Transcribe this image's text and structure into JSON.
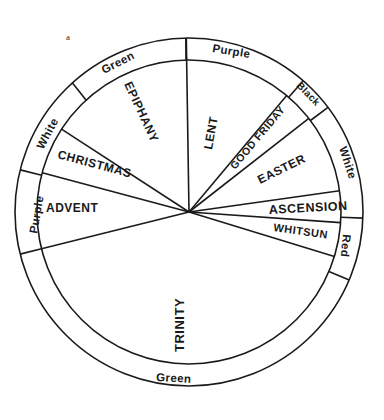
{
  "figure_label": "a",
  "geometry": {
    "center": [
      189,
      212
    ],
    "outer_radius": 174,
    "inner_radius": 152
  },
  "seasons": [
    {
      "name": "ADVENT",
      "start_deg": 256,
      "end_deg": 285
    },
    {
      "name": "CHRISTMAS",
      "start_deg": 285,
      "end_deg": 303
    },
    {
      "name": "EPIPHANY",
      "start_deg": 303,
      "end_deg": 359
    },
    {
      "name": "LENT",
      "start_deg": -1,
      "end_deg": 40
    },
    {
      "name": "GOOD FRIDAY",
      "start_deg": 40,
      "end_deg": 52
    },
    {
      "name": "EASTER",
      "start_deg": 52,
      "end_deg": 82
    },
    {
      "name": "ASCENSION",
      "start_deg": 82,
      "end_deg": 94
    },
    {
      "name": "WHITSUN",
      "start_deg": 94,
      "end_deg": 107
    },
    {
      "name": "TRINITY",
      "start_deg": 107,
      "end_deg": 256
    }
  ],
  "colors_ring": [
    {
      "name": "Purple",
      "start_deg": 256,
      "end_deg": 284
    },
    {
      "name": "White",
      "start_deg": 284,
      "end_deg": 318
    },
    {
      "name": "Green",
      "start_deg": 318,
      "end_deg": 359
    },
    {
      "name": "Purple",
      "start_deg": -1,
      "end_deg": 41
    },
    {
      "name": "Black",
      "start_deg": 41,
      "end_deg": 53
    },
    {
      "name": "White",
      "start_deg": 53,
      "end_deg": 92
    },
    {
      "name": "Red",
      "start_deg": 92,
      "end_deg": 113
    },
    {
      "name": "Green",
      "start_deg": 113,
      "end_deg": 256
    }
  ],
  "labels": {
    "advent": "ADVENT",
    "christmas": "CHRISTMAS",
    "epiphany": "EPIPHANY",
    "lent": "LENT",
    "good_friday": "GOOD FRIDAY",
    "easter": "EASTER",
    "ascension": "ASCENSION",
    "whitsun": "WHITSUN",
    "trinity": "TRINITY",
    "ring_purple_advent": "Purple",
    "ring_white_christmas": "White",
    "ring_green_epiphany": "Green",
    "ring_purple_lent": "Purple",
    "ring_black": "Black",
    "ring_white_easter": "White",
    "ring_red": "Red",
    "ring_green_trinity": "Green"
  }
}
